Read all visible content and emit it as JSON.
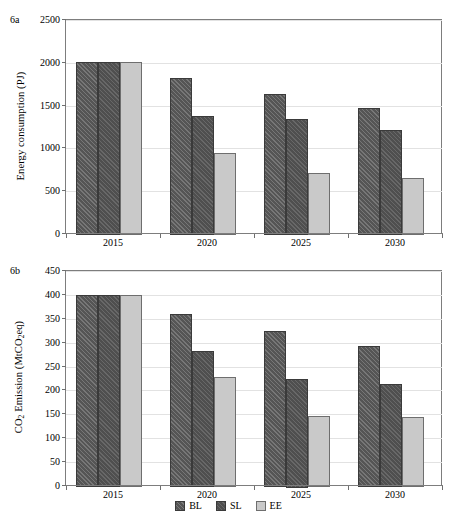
{
  "figure": {
    "width": 457,
    "height": 524
  },
  "legend": {
    "position": "bottom-center",
    "items": [
      {
        "key": "BL",
        "label": "BL",
        "color": "#555555",
        "pattern": "diagonal-hatch"
      },
      {
        "key": "SL",
        "label": "SL",
        "color": "#4f4f4f",
        "pattern": "diagonal-hatch"
      },
      {
        "key": "EE",
        "label": "EE",
        "color": "#c9c9c9",
        "pattern": "solid"
      }
    ]
  },
  "panels": [
    {
      "tag": "6a",
      "ylabel": "Energy consumption (PJ)",
      "ytick_labels": [
        "0",
        "500",
        "1000",
        "1500",
        "2000",
        "2500"
      ],
      "xtick_labels": [
        "2015",
        "2020",
        "2025",
        "2030"
      ]
    },
    {
      "tag": "6b",
      "ylabel_prefix": "CO",
      "ylabel_sub1": "2",
      "ylabel_mid": " Emission (MtCO",
      "ylabel_sub2": "2",
      "ylabel_suffix": "eq)",
      "ytick_labels": [
        "0",
        "50",
        "100",
        "150",
        "200",
        "250",
        "300",
        "350",
        "400",
        "450"
      ],
      "xtick_labels": [
        "2015",
        "2020",
        "2025",
        "2030"
      ]
    }
  ],
  "chart_data": [
    {
      "type": "bar",
      "panel": "6a",
      "title": "",
      "xlabel": "",
      "ylabel": "Energy consumption (PJ)",
      "ylim": [
        0,
        2500
      ],
      "ytick_step": 500,
      "yticks": [
        0,
        500,
        1000,
        1500,
        2000,
        2500
      ],
      "grid": true,
      "grid_axis": "y",
      "legend": "bottom-center-shared",
      "categories": [
        "2015",
        "2020",
        "2025",
        "2030"
      ],
      "series": [
        {
          "name": "BL",
          "values": [
            2010,
            1820,
            1635,
            1470
          ]
        },
        {
          "name": "SL",
          "values": [
            2010,
            1380,
            1340,
            1220
          ]
        },
        {
          "name": "EE",
          "values": [
            2005,
            945,
            715,
            660
          ]
        }
      ]
    },
    {
      "type": "bar",
      "panel": "6b",
      "title": "",
      "xlabel": "",
      "ylabel": "CO2 Emission (MtCO2eq)",
      "ylim": [
        0,
        450
      ],
      "ytick_step": 50,
      "yticks": [
        0,
        50,
        100,
        150,
        200,
        250,
        300,
        350,
        400,
        450
      ],
      "grid": true,
      "grid_axis": "y",
      "legend": "bottom-center-shared",
      "categories": [
        "2015",
        "2020",
        "2025",
        "2030"
      ],
      "series": [
        {
          "name": "BL",
          "values": [
            400,
            360,
            325,
            293
          ]
        },
        {
          "name": "SL",
          "values": [
            400,
            282,
            225,
            213
          ]
        },
        {
          "name": "EE",
          "values": [
            399,
            229,
            147,
            144
          ]
        }
      ]
    }
  ]
}
